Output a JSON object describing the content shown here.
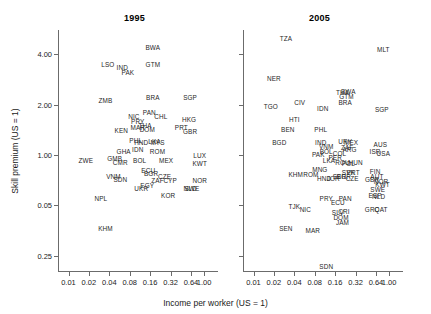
{
  "figure": {
    "yaxis_title": "Skill premium (US = 1)",
    "xaxis_title": "Income per worker (US = 1)"
  },
  "chart_data": {
    "type": "scatter",
    "title": "",
    "xlabel": "Income per worker (US = 1)",
    "ylabel": "Skill premium (US = 1)",
    "xscale": "log2",
    "yscale": "log",
    "grid": false,
    "legend": null,
    "point_marker": "text-label-only",
    "xticks": [
      "0.01",
      "0.02",
      "0.04",
      "0.08",
      "0.16",
      "0.32",
      "0.64",
      "1.00"
    ],
    "xtick_values": [
      0.01,
      0.02,
      0.04,
      0.08,
      0.16,
      0.32,
      0.64,
      1.0
    ],
    "yticks": [
      "4.00",
      "2.00",
      "1.00",
      "0.05",
      "0.25"
    ],
    "ytick_values": [
      4.0,
      2.0,
      1.0,
      0.5,
      0.25
    ],
    "xlim": [
      0.007,
      1.6
    ],
    "ylim": [
      0.2,
      5.6
    ],
    "panels": [
      {
        "label": "1995",
        "points": [
          {
            "code": "BWA",
            "x": 0.175,
            "y": 4.35
          },
          {
            "code": "GTM",
            "x": 0.175,
            "y": 3.45
          },
          {
            "code": "LSO",
            "x": 0.038,
            "y": 3.45
          },
          {
            "code": "IND",
            "x": 0.062,
            "y": 3.3
          },
          {
            "code": "PAK",
            "x": 0.075,
            "y": 3.1
          },
          {
            "code": "ZMB",
            "x": 0.035,
            "y": 2.1
          },
          {
            "code": "BRA",
            "x": 0.175,
            "y": 2.2
          },
          {
            "code": "SGP",
            "x": 0.62,
            "y": 2.2
          },
          {
            "code": "PAN",
            "x": 0.155,
            "y": 1.78
          },
          {
            "code": "NIC",
            "x": 0.092,
            "y": 1.68
          },
          {
            "code": "PRY",
            "x": 0.105,
            "y": 1.58
          },
          {
            "code": "CHL",
            "x": 0.23,
            "y": 1.68
          },
          {
            "code": "HKG",
            "x": 0.6,
            "y": 1.62
          },
          {
            "code": "THA",
            "x": 0.135,
            "y": 1.5
          },
          {
            "code": "MAR",
            "x": 0.105,
            "y": 1.45
          },
          {
            "code": "DOM",
            "x": 0.145,
            "y": 1.42
          },
          {
            "code": "PRT",
            "x": 0.46,
            "y": 1.45
          },
          {
            "code": "GBR",
            "x": 0.62,
            "y": 1.38
          },
          {
            "code": "KEN",
            "x": 0.06,
            "y": 1.4
          },
          {
            "code": "PHL",
            "x": 0.098,
            "y": 1.22
          },
          {
            "code": "HND",
            "x": 0.118,
            "y": 1.18
          },
          {
            "code": "MYS",
            "x": 0.205,
            "y": 1.18
          },
          {
            "code": "LKA",
            "x": 0.185,
            "y": 1.2
          },
          {
            "code": "IDN",
            "x": 0.105,
            "y": 1.07
          },
          {
            "code": "GHA",
            "x": 0.065,
            "y": 1.05
          },
          {
            "code": "ROM",
            "x": 0.205,
            "y": 1.05
          },
          {
            "code": "LUX",
            "x": 0.86,
            "y": 0.99
          },
          {
            "code": "ZWE",
            "x": 0.018,
            "y": 0.92
          },
          {
            "code": "GMB",
            "x": 0.048,
            "y": 0.95
          },
          {
            "code": "CMR",
            "x": 0.058,
            "y": 0.9
          },
          {
            "code": "BOL",
            "x": 0.112,
            "y": 0.92
          },
          {
            "code": "MEX",
            "x": 0.275,
            "y": 0.92
          },
          {
            "code": "KWT",
            "x": 0.86,
            "y": 0.88
          },
          {
            "code": "ECU",
            "x": 0.15,
            "y": 0.8
          },
          {
            "code": "CZE",
            "x": 0.26,
            "y": 0.74
          },
          {
            "code": "BGR",
            "x": 0.165,
            "y": 0.77
          },
          {
            "code": "VNM",
            "x": 0.046,
            "y": 0.74
          },
          {
            "code": "SDN",
            "x": 0.058,
            "y": 0.71
          },
          {
            "code": "ZAF",
            "x": 0.205,
            "y": 0.7
          },
          {
            "code": "CYP",
            "x": 0.315,
            "y": 0.7
          },
          {
            "code": "NOR",
            "x": 0.86,
            "y": 0.7
          },
          {
            "code": "UKR",
            "x": 0.118,
            "y": 0.63
          },
          {
            "code": "EGY",
            "x": 0.145,
            "y": 0.65
          },
          {
            "code": "NLD",
            "x": 0.62,
            "y": 0.63
          },
          {
            "code": "SWE",
            "x": 0.66,
            "y": 0.63
          },
          {
            "code": "KOR",
            "x": 0.295,
            "y": 0.57
          },
          {
            "code": "NPL",
            "x": 0.03,
            "y": 0.55
          },
          {
            "code": "KHM",
            "x": 0.035,
            "y": 0.36
          }
        ]
      },
      {
        "label": "2005",
        "points": [
          {
            "code": "TZA",
            "x": 0.03,
            "y": 4.95
          },
          {
            "code": "MLT",
            "x": 0.82,
            "y": 4.25
          },
          {
            "code": "NER",
            "x": 0.02,
            "y": 2.85
          },
          {
            "code": "TGO",
            "x": 0.018,
            "y": 1.95
          },
          {
            "code": "CIV",
            "x": 0.048,
            "y": 2.05
          },
          {
            "code": "THA",
            "x": 0.205,
            "y": 2.35
          },
          {
            "code": "BWA",
            "x": 0.25,
            "y": 2.4
          },
          {
            "code": "GTM",
            "x": 0.235,
            "y": 2.22
          },
          {
            "code": "BRA",
            "x": 0.225,
            "y": 2.05
          },
          {
            "code": "IDN",
            "x": 0.105,
            "y": 1.9
          },
          {
            "code": "SGP",
            "x": 0.78,
            "y": 1.85
          },
          {
            "code": "HTI",
            "x": 0.04,
            "y": 1.62
          },
          {
            "code": "BEN",
            "x": 0.032,
            "y": 1.42
          },
          {
            "code": "PHL",
            "x": 0.098,
            "y": 1.42
          },
          {
            "code": "BGD",
            "x": 0.024,
            "y": 1.18
          },
          {
            "code": "IND",
            "x": 0.098,
            "y": 1.18
          },
          {
            "code": "VNM",
            "x": 0.118,
            "y": 1.12
          },
          {
            "code": "URY",
            "x": 0.225,
            "y": 1.2
          },
          {
            "code": "MEX",
            "x": 0.275,
            "y": 1.18
          },
          {
            "code": "ZAF",
            "x": 0.24,
            "y": 1.1
          },
          {
            "code": "ARG",
            "x": 0.26,
            "y": 1.08
          },
          {
            "code": "ISR",
            "x": 0.62,
            "y": 1.05
          },
          {
            "code": "AUS",
            "x": 0.74,
            "y": 1.15
          },
          {
            "code": "USA",
            "x": 0.82,
            "y": 1.02
          },
          {
            "code": "PAK",
            "x": 0.09,
            "y": 1.0
          },
          {
            "code": "BOL",
            "x": 0.118,
            "y": 1.05
          },
          {
            "code": "COL",
            "x": 0.185,
            "y": 1.02
          },
          {
            "code": "PER",
            "x": 0.16,
            "y": 0.96
          },
          {
            "code": "LKA",
            "x": 0.13,
            "y": 0.92
          },
          {
            "code": "ROU",
            "x": 0.205,
            "y": 0.9
          },
          {
            "code": "POL",
            "x": 0.25,
            "y": 0.88
          },
          {
            "code": "HUN",
            "x": 0.32,
            "y": 0.9
          },
          {
            "code": "MNG",
            "x": 0.095,
            "y": 0.82
          },
          {
            "code": "KHM",
            "x": 0.042,
            "y": 0.76
          },
          {
            "code": "ROM",
            "x": 0.07,
            "y": 0.76
          },
          {
            "code": "HND",
            "x": 0.11,
            "y": 0.72
          },
          {
            "code": "JOR",
            "x": 0.15,
            "y": 0.72
          },
          {
            "code": "SER",
            "x": 0.185,
            "y": 0.74
          },
          {
            "code": "BGR",
            "x": 0.215,
            "y": 0.74
          },
          {
            "code": "PRT",
            "x": 0.295,
            "y": 0.78
          },
          {
            "code": "SVK",
            "x": 0.25,
            "y": 0.78
          },
          {
            "code": "CZE",
            "x": 0.285,
            "y": 0.72
          },
          {
            "code": "GBR",
            "x": 0.56,
            "y": 0.71
          },
          {
            "code": "FIN",
            "x": 0.62,
            "y": 0.79
          },
          {
            "code": "NOR",
            "x": 0.76,
            "y": 0.69
          },
          {
            "code": "AUT",
            "x": 0.66,
            "y": 0.74
          },
          {
            "code": "KWT",
            "x": 0.8,
            "y": 0.66
          },
          {
            "code": "SWE",
            "x": 0.68,
            "y": 0.62
          },
          {
            "code": "ESP",
            "x": 0.62,
            "y": 0.57
          },
          {
            "code": "NLD",
            "x": 0.7,
            "y": 0.56
          },
          {
            "code": "PRY",
            "x": 0.118,
            "y": 0.55
          },
          {
            "code": "ECU",
            "x": 0.175,
            "y": 0.52
          },
          {
            "code": "PAN",
            "x": 0.225,
            "y": 0.55
          },
          {
            "code": "TJK",
            "x": 0.04,
            "y": 0.49
          },
          {
            "code": "NIC",
            "x": 0.058,
            "y": 0.47
          },
          {
            "code": "SLV",
            "x": 0.175,
            "y": 0.45
          },
          {
            "code": "CRI",
            "x": 0.215,
            "y": 0.46
          },
          {
            "code": "GRC",
            "x": 0.56,
            "y": 0.47
          },
          {
            "code": "QAT",
            "x": 0.76,
            "y": 0.47
          },
          {
            "code": "DOM",
            "x": 0.195,
            "y": 0.42
          },
          {
            "code": "JAM",
            "x": 0.205,
            "y": 0.39
          },
          {
            "code": "SEN",
            "x": 0.03,
            "y": 0.36
          },
          {
            "code": "MAR",
            "x": 0.075,
            "y": 0.35
          },
          {
            "code": "SDN",
            "x": 0.118,
            "y": 0.215
          }
        ]
      }
    ]
  }
}
